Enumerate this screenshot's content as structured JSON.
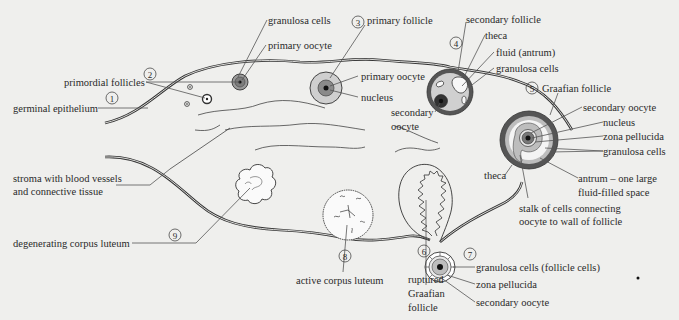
{
  "colors": {
    "background": "#efefed",
    "line": "#333333",
    "theca": "#555555",
    "granulosa": "#bdbdbd",
    "oocyte": "#8a8a8a",
    "nucleus": "#222222",
    "antrum": "#f4f4f4"
  },
  "stages": [
    {
      "number": "1",
      "label": "germinal epithelium"
    },
    {
      "number": "2",
      "label": "primordial follicles"
    },
    {
      "number": "3",
      "label": "primary follicle"
    },
    {
      "number": "4",
      "label": "secondary follicle"
    },
    {
      "number": "5",
      "label": "Graafian follicle"
    },
    {
      "number": "6",
      "label": "ruptured Graafian follicle"
    },
    {
      "number": "7",
      "label": "secondary oocyte (ovulated)"
    },
    {
      "number": "8",
      "label": "active corpus luteum"
    },
    {
      "number": "9",
      "label": "degenerating corpus luteum"
    }
  ],
  "labels": {
    "germinal_epithelium": "germinal epithelium",
    "primordial_follicles": "primordial follicles",
    "granulosa_cells_top": "granulosa cells",
    "primary_oocyte_top": "primary oocyte",
    "primary_follicle": "primary follicle",
    "primary_oocyte": "primary oocyte",
    "nucleus_primary": "nucleus",
    "secondary_follicle": "secondary follicle",
    "theca_secondary": "theca",
    "fluid_antrum": "fluid (antrum)",
    "granulosa_cells_secondary": "granulosa cells",
    "secondary_oocyte_line1": "secondary",
    "secondary_oocyte_line2": "oocyte",
    "graafian_follicle": "Graafian follicle",
    "secondary_oocyte_graafian": "secondary oocyte",
    "nucleus_graafian": "nucleus",
    "zona_pellucida_graafian": "zona pellucida",
    "granulosa_cells_graafian": "granulosa cells",
    "antrum_line1": "antrum – one large",
    "antrum_line2": "fluid-filled space",
    "theca_graafian": "theca",
    "stalk_line1": "stalk of cells connecting",
    "stalk_line2": "oocyte to wall of follicle",
    "stroma_line1": "stroma with blood vessels",
    "stroma_line2": "and connective tissue",
    "degenerating_corpus_luteum": "degenerating corpus luteum",
    "active_corpus_luteum": "active corpus luteum",
    "ruptured_line1": "ruptured",
    "ruptured_line2": "Graafian",
    "ruptured_line3": "follicle",
    "granulosa_follicle_cells": "granulosa cells (follicle cells)",
    "zona_pellucida_ovulated": "zona pellucida",
    "secondary_oocyte_ovulated": "secondary oocyte"
  },
  "numbers": {
    "n1": "1",
    "n2": "2",
    "n3": "3",
    "n4": "4",
    "n5": "5",
    "n6": "6",
    "n7": "7",
    "n8": "8",
    "n9": "9"
  }
}
